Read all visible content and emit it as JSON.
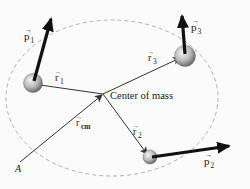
{
  "diagram": {
    "labels": {
      "center_of_mass": "Center of mass",
      "origin": "A",
      "r_cm": "r",
      "r_cm_sub": "cm",
      "r1": "r",
      "r1_sub": "1",
      "r2": "r",
      "r2_sub": "2",
      "r3": "r",
      "r3_sub": "3",
      "p1": "p",
      "p1_sub": "1",
      "p2": "p",
      "p2_sub": "2",
      "p3": "p",
      "p3_sub": "3"
    },
    "points": {
      "origin_A": [
        20,
        162
      ],
      "center_of_mass": [
        103,
        94
      ],
      "particle_1": [
        33,
        83
      ],
      "particle_2": [
        150,
        157
      ],
      "particle_3": [
        185,
        56
      ]
    },
    "momentum_tips": {
      "p1": [
        52,
        15
      ],
      "p2": [
        233,
        145
      ],
      "p3": [
        182,
        12
      ]
    },
    "boundary": {
      "shape": "dashed-ellipse",
      "cx": 112,
      "cy": 98,
      "rx": 106,
      "ry": 78
    },
    "colors": {
      "background": "#fbfbfb",
      "thin_vector": "#333333",
      "momentum_vector": "#111111",
      "boundary": "#a8a8a8",
      "particle_light": "#f2f2f2",
      "particle_dark": "#6a6a6a"
    }
  }
}
